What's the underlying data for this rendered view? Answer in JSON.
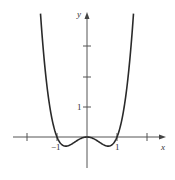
{
  "chart_data": {
    "type": "line",
    "title": "",
    "function": "y = x^4 - x^2",
    "xlabel": "x",
    "ylabel": "y",
    "xlim": [
      -2.5,
      2.6
    ],
    "ylim": [
      -1,
      4.1
    ],
    "x_ticks": [
      -2,
      -1,
      1,
      2
    ],
    "x_tick_labels": [
      {
        "value": -1,
        "label": "−1"
      },
      {
        "value": 1,
        "label": "1"
      }
    ],
    "y_ticks": [
      1,
      2,
      3
    ],
    "y_tick_labels": [
      {
        "value": 1,
        "label": "1"
      }
    ],
    "grid": false,
    "legend": null,
    "series": [
      {
        "name": "curve",
        "color": "#2a2a2a",
        "x": [
          -1.55,
          -1.4,
          -1.2,
          -1.0,
          -0.9,
          -0.7,
          -0.5,
          -0.3,
          0,
          0.3,
          0.5,
          0.7,
          0.9,
          1.0,
          1.2,
          1.4,
          1.55
        ],
        "y": [
          3.37,
          1.88,
          0.63,
          0,
          -0.15,
          -0.25,
          -0.19,
          -0.08,
          0,
          -0.08,
          -0.19,
          -0.25,
          -0.15,
          0,
          0.63,
          1.88,
          3.37
        ]
      }
    ]
  },
  "labels": {
    "x_axis": "x",
    "y_axis": "y",
    "tick_neg1": "−1",
    "tick_pos1": "1",
    "tick_y1": "1"
  }
}
